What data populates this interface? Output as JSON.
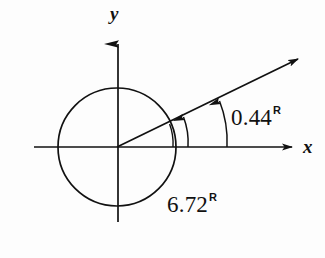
{
  "figure": {
    "type": "angle-diagram",
    "width": 325,
    "height": 258,
    "background_color": "#fdfdfd",
    "stroke_color": "#111111"
  },
  "axes": {
    "x_label": "x",
    "y_label": "y",
    "origin": {
      "x": 117,
      "y": 147
    },
    "x_start": {
      "x": 34,
      "y": 147
    },
    "x_end": {
      "x": 300,
      "y": 147
    },
    "y_start": {
      "x": 118,
      "y": 222
    },
    "y_end": {
      "x": 118,
      "y": 30
    }
  },
  "circle": {
    "name": "unit-circle",
    "center_x": 117,
    "center_y": 147,
    "radius": 59
  },
  "ray": {
    "name": "terminal-side",
    "angle_degrees": 25.2,
    "angle_radians": 0.44,
    "from": {
      "x": 117,
      "y": 147
    },
    "to": {
      "x": 307,
      "y": 55
    }
  },
  "arcs": [
    {
      "name": "angle-arc-outer",
      "label": "0.44",
      "unit": "R",
      "radius": 110,
      "direction": "counterclockwise",
      "start_degrees": 0,
      "end_degrees": 25.2
    },
    {
      "name": "angle-arc-inner",
      "label": "6.72",
      "unit": "R",
      "radius": 71,
      "direction": "counterclockwise",
      "start_degrees": 0,
      "end_degrees": 25.2
    }
  ],
  "labels": {
    "angle_value": "0.44",
    "angle_unit": "R",
    "coterminal_value": "6.72",
    "coterminal_unit": "R",
    "x_axis": "x",
    "y_axis": "y"
  }
}
